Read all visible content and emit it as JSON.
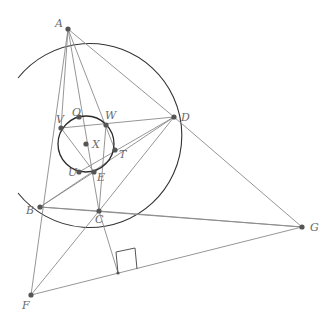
{
  "figure": {
    "type": "geometry-construction",
    "points": [
      {
        "id": "A",
        "label": "A",
        "x": 68,
        "y": 29,
        "lx": 55,
        "ly": 27
      },
      {
        "id": "D",
        "label": "D",
        "x": 174,
        "y": 117,
        "lx": 181,
        "ly": 121
      },
      {
        "id": "B",
        "label": "B",
        "x": 40,
        "y": 207,
        "lx": 26,
        "ly": 214
      },
      {
        "id": "C",
        "label": "C",
        "x": 99,
        "y": 211,
        "lx": 95,
        "ly": 223
      },
      {
        "id": "G",
        "label": "G",
        "x": 302,
        "y": 227,
        "lx": 310,
        "ly": 231
      },
      {
        "id": "F",
        "label": "F",
        "x": 31,
        "y": 295,
        "lx": 22,
        "ly": 309
      },
      {
        "id": "X",
        "label": "X",
        "x": 86,
        "y": 144,
        "lx": 92,
        "ly": 148
      },
      {
        "id": "V",
        "label": "V",
        "x": 61,
        "y": 128,
        "lx": 56,
        "ly": 123
      },
      {
        "id": "O",
        "label": "O",
        "x": 79,
        "y": 117,
        "lx": 72,
        "ly": 116
      },
      {
        "id": "W",
        "label": "W",
        "x": 106,
        "y": 125,
        "lx": 105,
        "ly": 119
      },
      {
        "id": "T",
        "label": "T",
        "x": 115,
        "y": 150,
        "lx": 119,
        "ly": 158
      },
      {
        "id": "U",
        "label": "U",
        "x": 79,
        "y": 172,
        "lx": 68,
        "ly": 176
      },
      {
        "id": "E",
        "label": "E",
        "x": 94,
        "y": 172,
        "lx": 97,
        "ly": 181
      }
    ],
    "incircle": {
      "cx": 86,
      "cy": 144,
      "r": 28
    },
    "big_arc": {
      "cx": 99,
      "cy": 121,
      "r": 92,
      "start": [
        18,
        78
      ],
      "end": [
        18,
        193
      ]
    },
    "segments": [
      [
        "A",
        "F"
      ],
      [
        "A",
        "V"
      ],
      [
        "A",
        "C"
      ],
      [
        "A",
        "T"
      ],
      [
        "A",
        "D"
      ],
      [
        "D",
        "V"
      ],
      [
        "D",
        "U"
      ],
      [
        "D",
        "C"
      ],
      [
        "D",
        "B"
      ],
      [
        "D",
        "G"
      ],
      [
        "B",
        "C"
      ],
      [
        "B",
        "G"
      ],
      [
        "B",
        "E"
      ],
      [
        "C",
        "F"
      ],
      [
        "C",
        "G"
      ],
      [
        "C",
        "W"
      ],
      [
        "V",
        "E"
      ],
      [
        "F",
        "G"
      ]
    ],
    "perpendicular": {
      "from": [
        99,
        211
      ],
      "foot": [
        118,
        273
      ]
    },
    "right_angle_marker": [
      [
        118,
        273
      ],
      [
        116,
        252
      ],
      [
        135,
        248
      ],
      [
        137,
        269
      ]
    ],
    "colors": {
      "line": "#8a8a8a",
      "circle": "#2a2a2a",
      "point": "#555555",
      "label": "#6a6a6a"
    }
  }
}
